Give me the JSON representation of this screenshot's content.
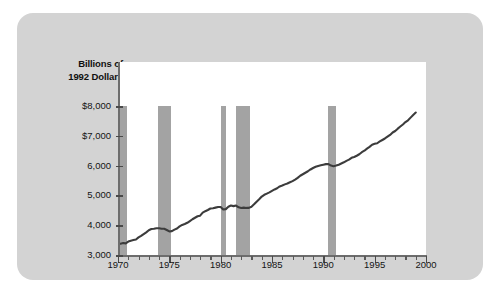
{
  "figure": {
    "y_axis_title_line1": "Billions of",
    "y_axis_title_line2": "1992 Dollars",
    "background_color": "#d3d3d3",
    "plot_background_color": "#ffffff",
    "line_color": "#3c3c3c",
    "recession_band_color": "#a3a3a3",
    "axis_color": "#6d6d6d"
  },
  "chart_data": {
    "type": "line",
    "title": "",
    "subtitle": "",
    "xlabel": "",
    "ylabel": "Billions of 1992 Dollars",
    "xlim": [
      1970,
      2000
    ],
    "ylim": [
      3000,
      8000
    ],
    "grid": false,
    "legend_position": "none",
    "y_tick_labels": [
      "$8,000",
      "$7,000",
      "6,000",
      "5,000",
      "4,000",
      "3,000"
    ],
    "y_ticks": [
      8000,
      7000,
      6000,
      5000,
      4000,
      3000
    ],
    "x_tick_labels": [
      "1970",
      "1975",
      "1980",
      "1985",
      "1990",
      "1995",
      "2000"
    ],
    "x_ticks": [
      1970,
      1975,
      1980,
      1985,
      1990,
      1995,
      2000
    ],
    "x_minor_tick_step": 1,
    "series": [
      {
        "name": "Real GDP",
        "color": "#3c3c3c",
        "x": [
          1970.0,
          1970.25,
          1970.5,
          1970.75,
          1971.0,
          1971.25,
          1971.5,
          1971.75,
          1972.0,
          1972.25,
          1972.5,
          1972.75,
          1973.0,
          1973.25,
          1973.5,
          1973.75,
          1974.0,
          1974.25,
          1974.5,
          1974.75,
          1975.0,
          1975.25,
          1975.5,
          1975.75,
          1976.0,
          1976.25,
          1976.5,
          1976.75,
          1977.0,
          1977.25,
          1977.5,
          1977.75,
          1978.0,
          1978.25,
          1978.5,
          1978.75,
          1979.0,
          1979.25,
          1979.5,
          1979.75,
          1980.0,
          1980.25,
          1980.5,
          1980.75,
          1981.0,
          1981.25,
          1981.5,
          1981.75,
          1982.0,
          1982.25,
          1982.5,
          1982.75,
          1983.0,
          1983.25,
          1983.5,
          1983.75,
          1984.0,
          1984.25,
          1984.5,
          1984.75,
          1985.0,
          1985.25,
          1985.5,
          1985.75,
          1986.0,
          1986.25,
          1986.5,
          1986.75,
          1987.0,
          1987.25,
          1987.5,
          1987.75,
          1988.0,
          1988.25,
          1988.5,
          1988.75,
          1989.0,
          1989.25,
          1989.5,
          1989.75,
          1990.0,
          1990.25,
          1990.5,
          1990.75,
          1991.0,
          1991.25,
          1991.5,
          1991.75,
          1992.0,
          1992.25,
          1992.5,
          1992.75,
          1993.0,
          1993.25,
          1993.5,
          1993.75,
          1994.0,
          1994.25,
          1994.5,
          1994.75,
          1995.0,
          1995.25,
          1995.5,
          1995.75,
          1996.0,
          1996.25,
          1996.5,
          1996.75,
          1997.0,
          1997.25,
          1997.5,
          1997.75,
          1998.0,
          1998.25,
          1998.5,
          1998.75,
          1999.0
        ],
        "y": [
          3390,
          3380,
          3400,
          3390,
          3450,
          3480,
          3500,
          3520,
          3590,
          3640,
          3700,
          3760,
          3830,
          3870,
          3880,
          3900,
          3900,
          3880,
          3880,
          3840,
          3790,
          3800,
          3850,
          3890,
          3960,
          4010,
          4040,
          4080,
          4140,
          4200,
          4250,
          4300,
          4320,
          4420,
          4470,
          4510,
          4560,
          4570,
          4590,
          4610,
          4610,
          4530,
          4540,
          4620,
          4660,
          4640,
          4660,
          4600,
          4580,
          4590,
          4580,
          4580,
          4620,
          4700,
          4790,
          4870,
          4960,
          5020,
          5060,
          5100,
          5150,
          5200,
          5240,
          5300,
          5330,
          5370,
          5400,
          5440,
          5480,
          5530,
          5590,
          5660,
          5710,
          5760,
          5810,
          5870,
          5920,
          5960,
          5990,
          6010,
          6030,
          6050,
          6050,
          6000,
          5980,
          6000,
          6030,
          6070,
          6110,
          6160,
          6200,
          6260,
          6290,
          6330,
          6380,
          6450,
          6500,
          6570,
          6630,
          6700,
          6730,
          6750,
          6810,
          6860,
          6910,
          6970,
          7030,
          7110,
          7160,
          7240,
          7310,
          7380,
          7460,
          7520,
          7610,
          7700,
          7780
        ]
      }
    ],
    "recession_bands": [
      {
        "label": "1969-1970 recession",
        "start": 1970.0,
        "end": 1970.9
      },
      {
        "label": "1973-1975 recession",
        "start": 1973.9,
        "end": 1975.2
      },
      {
        "label": "1980 recession",
        "start": 1980.0,
        "end": 1980.5
      },
      {
        "label": "1981-1982 recession",
        "start": 1981.5,
        "end": 1982.9
      },
      {
        "label": "1990-1991 recession",
        "start": 1990.5,
        "end": 1991.2
      }
    ]
  }
}
